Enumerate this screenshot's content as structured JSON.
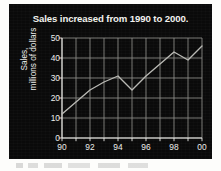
{
  "figure": {
    "panel_background": "#0a0a0a",
    "ink_color": "#ededea",
    "line_color": "#b9b9b4",
    "grid_color": "#8f8f8a"
  },
  "chart_data": {
    "type": "line",
    "title": "Sales increased from 1990 to 2000.",
    "subtitle": "",
    "xlabel": "",
    "ylabel": "Sales, millions of dollars",
    "ylabel_line1": "Sales,",
    "ylabel_line2": "millions of dollars",
    "x": [
      1990,
      1991,
      1992,
      1993,
      1994,
      1995,
      1996,
      1997,
      1998,
      1999,
      2000
    ],
    "xtick_labels": [
      "90",
      "92",
      "94",
      "96",
      "98",
      "00"
    ],
    "xtick_values": [
      1990,
      1992,
      1994,
      1996,
      1998,
      2000
    ],
    "ytick_labels": [
      "0",
      "10",
      "20",
      "30",
      "40",
      "50"
    ],
    "ytick_values": [
      0,
      10,
      20,
      30,
      40,
      50
    ],
    "series": [
      {
        "name": "Sales",
        "values": [
          12,
          18,
          24,
          28,
          31,
          24,
          31,
          37,
          43,
          39,
          46
        ]
      }
    ],
    "xlim": [
      1990,
      2000
    ],
    "ylim": [
      0,
      50
    ],
    "grid": true,
    "legend": "none",
    "markers": false,
    "annotations": []
  }
}
